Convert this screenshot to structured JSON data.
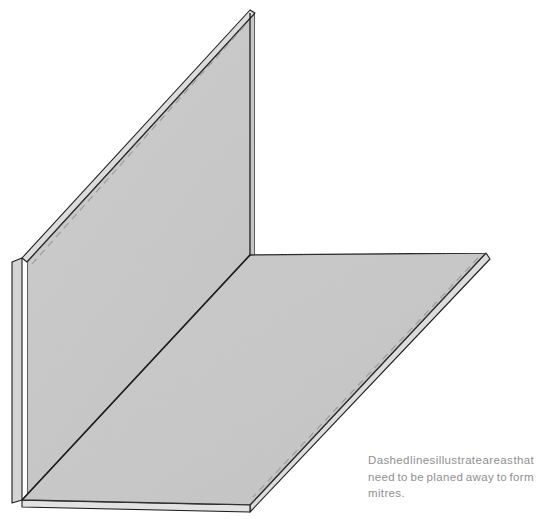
{
  "figure": {
    "caption": {
      "full_text": "Dashed lines illustrate areas that need to be planed away to form mitres.",
      "line_1_words": [
        "Dashed",
        "lines",
        "illustrate",
        "areas",
        "that"
      ],
      "line_2_words": [
        "need",
        "to",
        "be",
        "planed",
        "away",
        "to",
        "form"
      ],
      "line_3": "mitres.",
      "color": "#8f8f8f"
    },
    "colors": {
      "background": "#ffffff",
      "board_face": "#c9c9c9",
      "board_face_alt": "#cbcbcb",
      "edge_face_light": "#dedede",
      "edge_face_mid": "#d2d2d2",
      "outline": "#1d1d1d",
      "dashed_guide": "#9a9a9a",
      "caption_text": "#8f8f8f"
    },
    "parts": [
      {
        "name": "vertical-board",
        "label": "upright board",
        "vertices": "250,10 250,255 22,258 22,500",
        "has_dashed_guide": true
      },
      {
        "name": "horizontal-board",
        "label": "flat board",
        "vertices": "250,255 486,253 250,505 22,500",
        "has_dashed_guide": true
      },
      {
        "name": "joint-line",
        "label": "corner fold line",
        "from": "22,500",
        "to": "250,255"
      }
    ],
    "dashed_guides": [
      {
        "name": "vertical-board-top-guide",
        "from": "31,262",
        "to": "245,21"
      },
      {
        "name": "horizontal-board-front-guide",
        "from": "478,258",
        "to": "252,498"
      }
    ]
  }
}
